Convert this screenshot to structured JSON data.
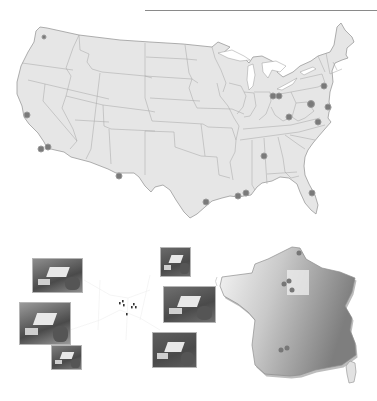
{
  "header": {
    "title": "",
    "rule_color": "#8a8a8a"
  },
  "us_map": {
    "fill": "#e6e6e6",
    "border": "#9a9a9a",
    "dot_color": "#7a7a7a",
    "sites": [
      {
        "name": "washington",
        "x": 44,
        "y": 37,
        "r": 2
      },
      {
        "name": "california-north",
        "x": 27,
        "y": 115,
        "r": 3
      },
      {
        "name": "california-south-1",
        "x": 41,
        "y": 149,
        "r": 3
      },
      {
        "name": "california-south-2",
        "x": 48,
        "y": 147,
        "r": 3
      },
      {
        "name": "new-mexico",
        "x": 119,
        "y": 176,
        "r": 3
      },
      {
        "name": "texas-houston",
        "x": 206,
        "y": 202,
        "r": 3
      },
      {
        "name": "louisiana-1",
        "x": 238,
        "y": 196,
        "r": 3
      },
      {
        "name": "louisiana-2",
        "x": 246,
        "y": 193,
        "r": 3
      },
      {
        "name": "alabama",
        "x": 264,
        "y": 156,
        "r": 3
      },
      {
        "name": "florida",
        "x": 312,
        "y": 193,
        "r": 3
      },
      {
        "name": "ohio-1",
        "x": 273,
        "y": 96,
        "r": 3
      },
      {
        "name": "ohio-2",
        "x": 279,
        "y": 96,
        "r": 3
      },
      {
        "name": "west-virginia",
        "x": 289,
        "y": 117,
        "r": 3
      },
      {
        "name": "maryland",
        "x": 311,
        "y": 104,
        "r": 3.5
      },
      {
        "name": "delaware-coast",
        "x": 328,
        "y": 107,
        "r": 3
      },
      {
        "name": "virginia",
        "x": 318,
        "y": 122,
        "r": 3
      },
      {
        "name": "new-jersey",
        "x": 324,
        "y": 86,
        "r": 3
      }
    ]
  },
  "campus_map": {
    "markers": [
      {
        "x": 119,
        "y": 302
      },
      {
        "x": 122,
        "y": 300
      },
      {
        "x": 123,
        "y": 304
      },
      {
        "x": 133,
        "y": 303
      },
      {
        "x": 135,
        "y": 306
      },
      {
        "x": 131,
        "y": 306
      },
      {
        "x": 126,
        "y": 313
      }
    ],
    "photos": [
      {
        "name": "photo-facility-1",
        "x": 32,
        "y": 258,
        "w": 49,
        "h": 33
      },
      {
        "name": "photo-facility-2",
        "x": 19,
        "y": 302,
        "w": 50,
        "h": 41
      },
      {
        "name": "photo-facility-3",
        "x": 51,
        "y": 345,
        "w": 29,
        "h": 23
      },
      {
        "name": "photo-facility-4",
        "x": 160,
        "y": 247,
        "w": 29,
        "h": 28
      },
      {
        "name": "photo-facility-5",
        "x": 163,
        "y": 286,
        "w": 51,
        "h": 35
      },
      {
        "name": "photo-facility-6",
        "x": 152,
        "y": 332,
        "w": 43,
        "h": 34
      }
    ]
  },
  "france_map": {
    "fill_light": "#f2f2f2",
    "fill_dark": "#8c8c8c",
    "highlight_region": {
      "x": 287,
      "y": 270,
      "w": 22,
      "h": 25,
      "color": "#ececec"
    },
    "sites": [
      {
        "name": "north",
        "x": 299,
        "y": 253,
        "r": 2.5
      },
      {
        "name": "paris-1",
        "x": 284,
        "y": 284,
        "r": 2.5
      },
      {
        "name": "paris-2",
        "x": 289,
        "y": 281,
        "r": 2.5
      },
      {
        "name": "paris-3",
        "x": 292,
        "y": 290,
        "r": 2.5
      },
      {
        "name": "south-1",
        "x": 281,
        "y": 350,
        "r": 2.5
      },
      {
        "name": "south-2",
        "x": 287,
        "y": 348,
        "r": 2.5
      }
    ]
  }
}
